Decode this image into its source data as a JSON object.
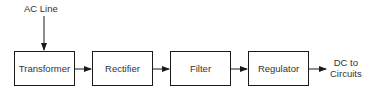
{
  "diagram": {
    "type": "block-diagram",
    "input_label": "AC Line",
    "output_label_line1": "DC to",
    "output_label_line2": "Circuits",
    "blocks": [
      {
        "id": "transformer",
        "label": "Transformer"
      },
      {
        "id": "rectifier",
        "label": "Rectifier"
      },
      {
        "id": "filter",
        "label": "Filter"
      },
      {
        "id": "regulator",
        "label": "Regulator"
      }
    ],
    "edges": [
      {
        "from": "AC Line",
        "to": "Transformer"
      },
      {
        "from": "Transformer",
        "to": "Rectifier"
      },
      {
        "from": "Rectifier",
        "to": "Filter"
      },
      {
        "from": "Filter",
        "to": "Regulator"
      },
      {
        "from": "Regulator",
        "to": "DC to Circuits"
      }
    ],
    "colors": {
      "line": "#1a1a1a",
      "text": "#333333",
      "background": "#ffffff"
    }
  }
}
